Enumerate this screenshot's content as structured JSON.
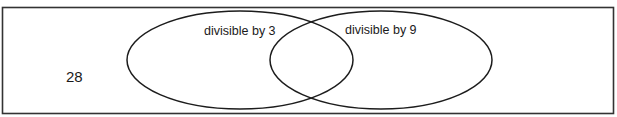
{
  "diagram": {
    "type": "venn",
    "frame": {
      "x": 2.5,
      "y": 7.5,
      "width": 611,
      "height": 106,
      "stroke": "#333333"
    },
    "sets": [
      {
        "label": "divisible by 3",
        "cx": 240,
        "cy": 60,
        "rx": 113,
        "ry": 49,
        "label_x": 204,
        "label_y": 34
      },
      {
        "label": "divisible by 9",
        "cx": 381,
        "cy": 60,
        "rx": 111,
        "ry": 49,
        "label_x": 345,
        "label_y": 33
      }
    ],
    "outside_value": {
      "text": "28",
      "x": 66,
      "y": 82
    },
    "stroke_color": "#1c1c1c",
    "background": "#ffffff"
  }
}
